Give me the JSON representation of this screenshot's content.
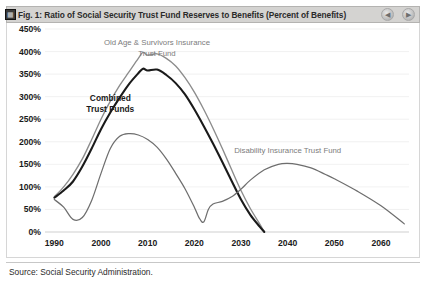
{
  "window": {
    "title": "Fig. 1: Ratio of Social Security Trust Fund Reserves to Benefits (Percent of Benefits)",
    "prev_icon": "◀",
    "next_icon": "▶",
    "corner_icon_glyph": "▦"
  },
  "footer": {
    "source": "Source: Social Security Administration."
  },
  "colors": {
    "oasi": "#8c8c8c",
    "combined": "#1a1a1a",
    "disability": "#6e6e6e",
    "grid": "#ededed",
    "titlebar": "#d4d3d1"
  },
  "chart_data": {
    "type": "line",
    "title": "Fig. 1: Ratio of Social Security Trust Fund Reserves to Benefits (Percent of Benefits)",
    "xlabel": "",
    "ylabel": "",
    "grid": true,
    "legend": "in-plot annotations",
    "xlim": [
      1988,
      2066
    ],
    "ylim": [
      0,
      450
    ],
    "xticks": [
      1990,
      2000,
      2010,
      2020,
      2030,
      2040,
      2050,
      2060
    ],
    "xtick_labels": [
      "1990",
      "2000",
      "2010",
      "2020",
      "2030",
      "2040",
      "2050",
      "2060"
    ],
    "yticks": [
      0,
      50,
      100,
      150,
      200,
      250,
      300,
      350,
      400,
      450
    ],
    "ytick_labels": [
      "0%",
      "50%",
      "100%",
      "150%",
      "200%",
      "250%",
      "300%",
      "350%",
      "400%",
      "450%"
    ],
    "annotations": [
      {
        "text": "Old Age & Survivors Insurance",
        "text2": "Trust Fund",
        "x": 2012,
        "y": 415
      },
      {
        "text": "Combined",
        "text2": "Trust Funds",
        "x": 2002,
        "y": 290
      },
      {
        "text": "Disability Insurance Trust Fund",
        "text2": "",
        "x": 2040,
        "y": 175
      }
    ],
    "series": [
      {
        "name": "Old Age & Survivors Insurance Trust Fund",
        "color": "#8c8c8c",
        "x": [
          1990,
          1992,
          1994,
          1996,
          1998,
          2000,
          2002,
          2004,
          2006,
          2008,
          2009,
          2010,
          2012,
          2014,
          2016,
          2018,
          2020,
          2022,
          2024,
          2026,
          2028,
          2030,
          2032,
          2034,
          2035
        ],
        "values": [
          78,
          100,
          128,
          162,
          205,
          250,
          290,
          325,
          355,
          385,
          398,
          392,
          395,
          385,
          368,
          342,
          310,
          272,
          230,
          185,
          138,
          92,
          52,
          18,
          0
        ]
      },
      {
        "name": "Combined Trust Funds",
        "color": "#1a1a1a",
        "x": [
          1990,
          1992,
          1994,
          1996,
          1998,
          2000,
          2002,
          2004,
          2006,
          2008,
          2009,
          2010,
          2012,
          2014,
          2016,
          2018,
          2020,
          2022,
          2024,
          2026,
          2028,
          2030,
          2032,
          2034,
          2035
        ],
        "values": [
          76,
          92,
          112,
          145,
          185,
          228,
          265,
          298,
          328,
          352,
          362,
          358,
          360,
          348,
          330,
          305,
          272,
          235,
          196,
          155,
          113,
          72,
          38,
          12,
          0
        ]
      },
      {
        "name": "Disability Insurance Trust Fund",
        "color": "#6e6e6e",
        "x": [
          1990,
          1992,
          1994,
          1996,
          1998,
          2000,
          2002,
          2004,
          2006,
          2008,
          2010,
          2012,
          2014,
          2016,
          2018,
          2020,
          2021,
          2022,
          2023,
          2024,
          2026,
          2028,
          2030,
          2032,
          2035,
          2038,
          2040,
          2042,
          2045,
          2048,
          2050,
          2055,
          2060,
          2065
        ],
        "values": [
          72,
          55,
          28,
          32,
          70,
          130,
          185,
          212,
          218,
          215,
          205,
          188,
          162,
          130,
          96,
          55,
          32,
          22,
          50,
          62,
          68,
          78,
          95,
          115,
          138,
          150,
          152,
          150,
          142,
          128,
          118,
          90,
          58,
          18
        ]
      }
    ]
  }
}
